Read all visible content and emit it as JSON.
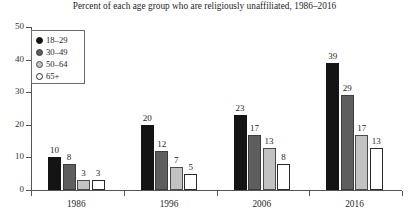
{
  "chart_data": {
    "type": "bar",
    "title": "Percent of each age group who are religiously unaffiliated, 1986–2016",
    "xlabel": "",
    "ylabel": "",
    "categories": [
      "1986",
      "1996",
      "2006",
      "2016"
    ],
    "series": [
      {
        "name": "18–29",
        "color": "#141414",
        "values": [
          10,
          20,
          23,
          39
        ]
      },
      {
        "name": "30–49",
        "color": "#5e5e5e",
        "values": [
          8,
          12,
          17,
          29
        ]
      },
      {
        "name": "50–64",
        "color": "#c2c2c2",
        "values": [
          3,
          7,
          13,
          17
        ]
      },
      {
        "name": "65+",
        "color": "#ffffff",
        "values": [
          3,
          5,
          8,
          13
        ]
      }
    ],
    "ylim": [
      0,
      50
    ],
    "yticks": [
      0,
      10,
      20,
      30,
      40,
      50
    ],
    "ytick_labels": [
      "0",
      "10",
      "20",
      "30",
      "40",
      "50"
    ],
    "grid": false,
    "legend_position": "top-left",
    "data_labels": true
  },
  "legend": {
    "items": [
      {
        "label": "18–29"
      },
      {
        "label": "30–49"
      },
      {
        "label": "50–64"
      },
      {
        "label": "65+"
      }
    ]
  }
}
